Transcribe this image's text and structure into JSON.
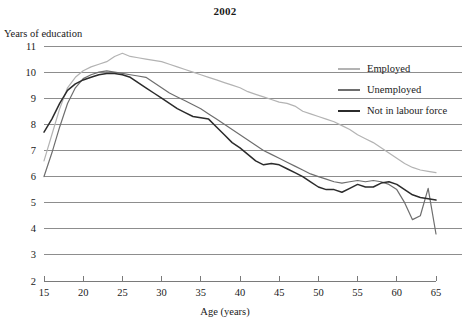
{
  "chart_data": {
    "type": "line",
    "title": "2002",
    "xlabel": "Age (years)",
    "ylabel": "Years of education",
    "xlim": [
      15,
      65
    ],
    "ylim": [
      2,
      11
    ],
    "grid": true,
    "legend_position": "right-top",
    "xticks": [
      15,
      20,
      25,
      30,
      35,
      40,
      45,
      50,
      55,
      60,
      65
    ],
    "yticks": [
      2,
      3,
      4,
      5,
      6,
      7,
      8,
      9,
      10,
      11
    ],
    "x": [
      15,
      16,
      17,
      18,
      19,
      20,
      21,
      22,
      23,
      24,
      25,
      26,
      27,
      28,
      29,
      30,
      31,
      32,
      33,
      34,
      35,
      36,
      37,
      38,
      39,
      40,
      41,
      42,
      43,
      44,
      45,
      46,
      47,
      48,
      49,
      50,
      51,
      52,
      53,
      54,
      55,
      56,
      57,
      58,
      59,
      60,
      61,
      62,
      63,
      64,
      65
    ],
    "series": [
      {
        "name": "Employed",
        "color": "#b3b3b3",
        "values": [
          6.6,
          7.6,
          8.6,
          9.4,
          9.8,
          10.05,
          10.2,
          10.3,
          10.4,
          10.6,
          10.72,
          10.6,
          10.55,
          10.5,
          10.45,
          10.4,
          10.3,
          10.2,
          10.1,
          10.0,
          9.9,
          9.8,
          9.7,
          9.6,
          9.5,
          9.4,
          9.25,
          9.15,
          9.05,
          8.95,
          8.85,
          8.8,
          8.7,
          8.5,
          8.4,
          8.3,
          8.2,
          8.1,
          7.95,
          7.8,
          7.6,
          7.45,
          7.3,
          7.1,
          6.9,
          6.7,
          6.5,
          6.35,
          6.25,
          6.2,
          6.15
        ]
      },
      {
        "name": "Unemployed",
        "color": "#6e6e6e",
        "values": [
          6.0,
          6.9,
          7.9,
          8.8,
          9.4,
          9.75,
          9.9,
          10.0,
          10.05,
          10.0,
          9.95,
          9.9,
          9.85,
          9.8,
          9.6,
          9.4,
          9.2,
          9.05,
          8.9,
          8.75,
          8.6,
          8.4,
          8.2,
          8.0,
          7.8,
          7.6,
          7.4,
          7.2,
          7.0,
          6.85,
          6.7,
          6.55,
          6.4,
          6.25,
          6.1,
          6.0,
          5.9,
          5.8,
          5.75,
          5.8,
          5.85,
          5.8,
          5.85,
          5.8,
          5.7,
          5.5,
          5.0,
          4.35,
          4.5,
          5.55,
          3.8
        ]
      },
      {
        "name": "Not in labour force",
        "color": "#2b2b2b",
        "values": [
          7.7,
          8.2,
          8.8,
          9.3,
          9.55,
          9.7,
          9.8,
          9.9,
          9.95,
          9.95,
          9.9,
          9.8,
          9.6,
          9.4,
          9.2,
          9.0,
          8.8,
          8.6,
          8.45,
          8.3,
          8.25,
          8.2,
          7.9,
          7.6,
          7.3,
          7.1,
          6.85,
          6.6,
          6.45,
          6.5,
          6.45,
          6.3,
          6.15,
          6.0,
          5.8,
          5.6,
          5.5,
          5.5,
          5.4,
          5.55,
          5.7,
          5.6,
          5.6,
          5.75,
          5.8,
          5.7,
          5.5,
          5.3,
          5.2,
          5.15,
          5.1
        ]
      }
    ]
  },
  "legend": {
    "items": [
      {
        "label": "Employed"
      },
      {
        "label": "Unemployed"
      },
      {
        "label": "Not in labour force"
      }
    ]
  }
}
